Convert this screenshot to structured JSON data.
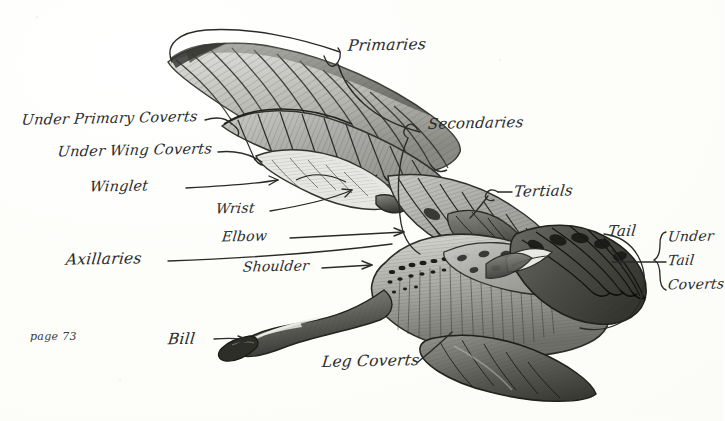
{
  "page": {
    "page_number_label": "page 73",
    "background_color": "#fdfdfb",
    "ink_color": "#2b2b2b"
  },
  "labels": {
    "under_primary_coverts": "Under Primary Coverts",
    "under_wing_coverts": "Under Wing Coverts",
    "winglet": "Winglet",
    "axillaries": "Axillaries",
    "wrist": "Wrist",
    "elbow": "Elbow",
    "shoulder": "Shoulder",
    "bill": "Bill",
    "leg_coverts": "Leg Coverts",
    "primaries": "Primaries",
    "secondaries": "Secondaries",
    "tertials": "Tertials",
    "tail": "Tail",
    "under_tail_coverts_line1": "Under",
    "under_tail_coverts_line2": "Tail",
    "under_tail_coverts_line3": "Coverts"
  }
}
